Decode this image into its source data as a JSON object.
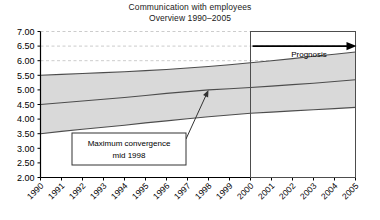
{
  "chart_data": {
    "type": "area",
    "title": "Communication with employees",
    "subtitle": "Overview 1990–2005",
    "xlabel": "",
    "ylabel": "",
    "categories": [
      "1990",
      "1991",
      "1992",
      "1993",
      "1994",
      "1995",
      "1996",
      "1997",
      "1998",
      "1999",
      "2000",
      "2001",
      "2002",
      "2003",
      "2004",
      "2005"
    ],
    "ylim": [
      2.0,
      7.0
    ],
    "ytick_step": 0.5,
    "ytick_labels": [
      "7.00",
      "6.50",
      "6.00",
      "5.50",
      "5.00",
      "4.50",
      "4.00",
      "3.50",
      "3.00",
      "2.50",
      "2.00"
    ],
    "grid": "horizontal-dashed-above-5.50",
    "legend": "none",
    "series": [
      {
        "name": "Upper band",
        "values": [
          5.5,
          5.53,
          5.56,
          5.59,
          5.62,
          5.66,
          5.7,
          5.75,
          5.8,
          5.86,
          5.93,
          6.0,
          6.07,
          6.15,
          6.22,
          6.3
        ]
      },
      {
        "name": "Mean",
        "values": [
          4.5,
          4.56,
          4.62,
          4.68,
          4.74,
          4.81,
          4.88,
          4.94,
          5.0,
          5.04,
          5.08,
          5.13,
          5.18,
          5.23,
          5.29,
          5.35
        ]
      },
      {
        "name": "Lower band",
        "values": [
          3.5,
          3.58,
          3.65,
          3.72,
          3.79,
          3.87,
          3.94,
          4.01,
          4.08,
          4.14,
          4.2,
          4.24,
          4.28,
          4.32,
          4.36,
          4.4
        ]
      }
    ],
    "annotations": [
      {
        "id": "max-convergence",
        "line1": "Maximum convergence",
        "line2": "mid 1998",
        "points_to_year": 1998,
        "points_to_value": 5.0
      },
      {
        "id": "prognosis",
        "label": "Prognosis",
        "start_year": 2000,
        "end_year": 2005
      }
    ],
    "colors": {
      "band_fill": "#d9d9d9",
      "line": "#4d4d4d",
      "axis": "#000000",
      "grid": "#cccccc",
      "text": "#000000"
    }
  }
}
